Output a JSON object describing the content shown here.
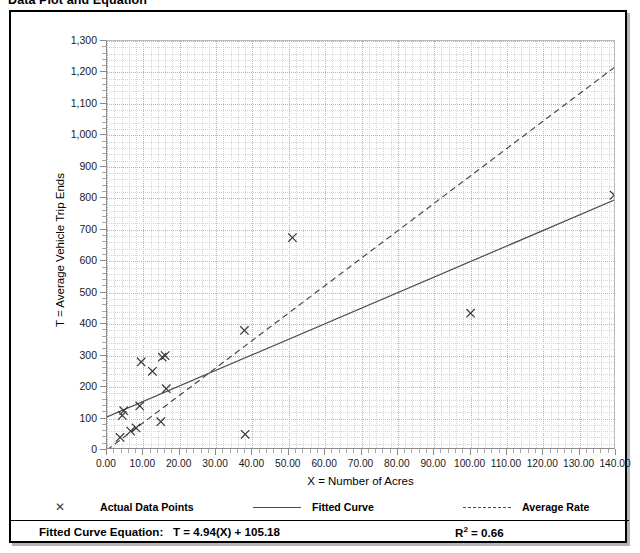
{
  "figure": {
    "title": "Data Plot and Equation"
  },
  "chart_data": {
    "type": "scatter",
    "title": "Data Plot and Equation",
    "xlabel": "X = Number of Acres",
    "ylabel": "T = Average Vehicle Trip Ends",
    "xlim": [
      0,
      140
    ],
    "ylim": [
      0,
      1300
    ],
    "xticks": [
      0,
      10,
      20,
      30,
      40,
      50,
      60,
      70,
      80,
      90,
      100,
      110,
      120,
      130,
      140
    ],
    "xtick_labels": [
      "0.00",
      "10.00",
      "20.00",
      "30.00",
      "40.00",
      "50.00",
      "60.00",
      "70.00",
      "80.00",
      "90.00",
      "100.00",
      "110.00",
      "120.00",
      "130.00",
      "140.00"
    ],
    "yticks": [
      0,
      100,
      200,
      300,
      400,
      500,
      600,
      700,
      800,
      900,
      1000,
      1100,
      1200,
      1300
    ],
    "ytick_labels": [
      "0",
      "100",
      "200",
      "300",
      "400",
      "500",
      "600",
      "700",
      "800",
      "900",
      "1,000",
      "1,100",
      "1,200",
      "1,300"
    ],
    "grid": true,
    "minor_grid": true,
    "legend_position": "below-axes",
    "series": [
      {
        "name": "Actual Data Points",
        "type": "scatter",
        "marker": "x",
        "color": "#3a3a3a",
        "points": [
          [
            3.6,
            40
          ],
          [
            4.2,
            110
          ],
          [
            4.6,
            125
          ],
          [
            6.5,
            60
          ],
          [
            8.0,
            70
          ],
          [
            9.0,
            140
          ],
          [
            9.4,
            280
          ],
          [
            12.5,
            250
          ],
          [
            14.8,
            90
          ],
          [
            15.2,
            295
          ],
          [
            16.0,
            300
          ],
          [
            16.3,
            195
          ],
          [
            37.8,
            380
          ],
          [
            38.0,
            50
          ],
          [
            51.0,
            675
          ],
          [
            100.0,
            435
          ],
          [
            139.5,
            810
          ]
        ]
      },
      {
        "name": "Fitted Curve",
        "type": "line",
        "style": "solid",
        "color": "#4a4a4a",
        "equation": "T = 4.94(X) + 105.18",
        "slope": 4.94,
        "intercept": 105.18,
        "endpoints": [
          [
            0,
            105.18
          ],
          [
            140,
            796.78
          ]
        ]
      },
      {
        "name": "Average Rate",
        "type": "line",
        "style": "dashed",
        "color": "#4a4a4a",
        "endpoints": [
          [
            0,
            0
          ],
          [
            140,
            1220
          ]
        ]
      }
    ],
    "annotations": {
      "equation_label": "Fitted Curve Equation:",
      "equation_value": "T = 4.94(X) + 105.18",
      "r_squared_label": "R",
      "r_squared_exponent": "2",
      "r_squared_value": "= 0.66"
    }
  },
  "legend": {
    "items": [
      {
        "label": "Actual Data Points",
        "marker": "x-marker-icon"
      },
      {
        "label": "Fitted Curve",
        "marker": "solid-line-icon"
      },
      {
        "label": "Average Rate",
        "marker": "dashed-line-icon"
      }
    ]
  }
}
